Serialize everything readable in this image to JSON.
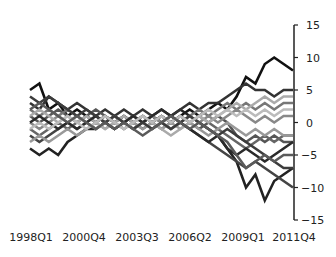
{
  "chart_data": {
    "type": "line",
    "title": "",
    "xlabel": "",
    "ylabel": "",
    "ylim": [
      -15,
      15
    ],
    "y_ticks": [
      15,
      10,
      5,
      0,
      -5,
      -10,
      -15
    ],
    "x_tick_labels": [
      "1998Q1",
      "2000Q4",
      "2003Q3",
      "2006Q2",
      "2009Q1",
      "2011Q4"
    ],
    "y_axis_position": "right",
    "grid": false,
    "legend": "none",
    "x": [
      "1998Q1",
      "1998Q3",
      "1999Q1",
      "1999Q3",
      "2000Q1",
      "2000Q3",
      "2001Q1",
      "2001Q3",
      "2002Q1",
      "2002Q3",
      "2003Q1",
      "2003Q3",
      "2004Q1",
      "2004Q3",
      "2005Q1",
      "2005Q3",
      "2006Q1",
      "2006Q3",
      "2007Q1",
      "2007Q3",
      "2008Q1",
      "2008Q3",
      "2009Q1",
      "2009Q3",
      "2010Q1",
      "2010Q3",
      "2011Q1",
      "2011Q3",
      "2011Q4"
    ],
    "series": [
      {
        "name": "s1",
        "color": "#111111",
        "values": [
          5,
          6,
          2,
          3,
          1,
          2,
          1,
          0,
          1,
          0,
          1,
          0,
          1,
          0,
          1,
          0,
          1,
          2,
          1,
          2,
          3,
          2,
          4,
          7,
          6,
          9,
          10,
          9,
          8
        ]
      },
      {
        "name": "s2",
        "color": "#222222",
        "values": [
          -4,
          -5,
          -4,
          -5,
          -3,
          -2,
          -1,
          -1,
          0,
          -1,
          0,
          -1,
          0,
          1,
          0,
          1,
          2,
          1,
          0,
          -1,
          -2,
          -4,
          -6,
          -10,
          -8,
          -12,
          -9,
          -8,
          -7
        ]
      },
      {
        "name": "s3",
        "color": "#333333",
        "values": [
          3,
          2,
          4,
          3,
          2,
          3,
          2,
          1,
          2,
          1,
          2,
          1,
          2,
          1,
          2,
          1,
          2,
          3,
          2,
          3,
          3,
          4,
          5,
          6,
          5,
          5,
          4,
          5,
          5
        ]
      },
      {
        "name": "s4",
        "color": "#444444",
        "values": [
          -2,
          -3,
          -2,
          -1,
          0,
          -1,
          0,
          -1,
          0,
          1,
          0,
          1,
          0,
          1,
          0,
          -1,
          0,
          -1,
          -2,
          -3,
          -4,
          -5,
          -6,
          -7,
          -6,
          -7,
          -8,
          -9,
          -10
        ]
      },
      {
        "name": "s5",
        "color": "#555555",
        "values": [
          1,
          0,
          1,
          2,
          1,
          0,
          1,
          2,
          1,
          0,
          1,
          0,
          -1,
          0,
          1,
          0,
          1,
          0,
          -1,
          0,
          1,
          0,
          -2,
          -3,
          -2,
          -3,
          -2,
          -3,
          -3
        ]
      },
      {
        "name": "s6",
        "color": "#666666",
        "values": [
          -1,
          -2,
          -1,
          0,
          -1,
          0,
          1,
          0,
          1,
          0,
          -1,
          0,
          1,
          0,
          -1,
          0,
          1,
          0,
          1,
          0,
          -1,
          -2,
          -3,
          -4,
          -3,
          -2,
          -3,
          -2,
          -2
        ]
      },
      {
        "name": "s7",
        "color": "#777777",
        "values": [
          2,
          1,
          2,
          1,
          2,
          1,
          0,
          1,
          0,
          1,
          0,
          1,
          0,
          -1,
          0,
          1,
          0,
          1,
          2,
          1,
          2,
          3,
          2,
          3,
          2,
          3,
          2,
          3,
          3
        ]
      },
      {
        "name": "s8",
        "color": "#888888",
        "values": [
          0,
          -1,
          0,
          1,
          0,
          1,
          0,
          -1,
          0,
          1,
          0,
          -1,
          0,
          1,
          0,
          -1,
          0,
          1,
          0,
          1,
          0,
          1,
          2,
          1,
          0,
          1,
          0,
          1,
          1
        ]
      },
      {
        "name": "s9",
        "color": "#999999",
        "values": [
          -3,
          -2,
          -3,
          -2,
          -1,
          -2,
          -1,
          0,
          -1,
          0,
          -1,
          0,
          -1,
          0,
          -1,
          0,
          -1,
          0,
          -1,
          -2,
          -1,
          0,
          -1,
          -2,
          -1,
          -2,
          -1,
          -2,
          -2
        ]
      },
      {
        "name": "s10",
        "color": "#aaaaaa",
        "values": [
          1,
          2,
          1,
          0,
          1,
          0,
          1,
          0,
          -1,
          0,
          1,
          0,
          1,
          0,
          -1,
          -2,
          -1,
          0,
          1,
          0,
          1,
          2,
          3,
          2,
          3,
          4,
          3,
          4,
          4
        ]
      },
      {
        "name": "s11",
        "color": "#2a2a2a",
        "values": [
          0,
          1,
          0,
          -1,
          0,
          -1,
          0,
          1,
          0,
          -1,
          0,
          1,
          0,
          1,
          2,
          1,
          0,
          -1,
          -2,
          -3,
          -2,
          -4,
          -5,
          -4,
          -5,
          -6,
          -5,
          -4,
          -3
        ]
      },
      {
        "name": "s12",
        "color": "#3c3c3c",
        "values": [
          4,
          3,
          4,
          3,
          2,
          1,
          2,
          1,
          0,
          1,
          0,
          -1,
          0,
          -1,
          0,
          -1,
          0,
          1,
          0,
          -1,
          -2,
          -1,
          -2,
          -3,
          -4,
          -5,
          -6,
          -7,
          -7
        ]
      },
      {
        "name": "s13",
        "color": "#bbbbbb",
        "values": [
          -1,
          0,
          -1,
          0,
          1,
          0,
          -1,
          0,
          1,
          0,
          -1,
          0,
          1,
          0,
          1,
          0,
          1,
          0,
          1,
          2,
          1,
          2,
          1,
          2,
          1,
          2,
          1,
          2,
          2
        ]
      },
      {
        "name": "s14",
        "color": "#5a5a5a",
        "values": [
          2,
          3,
          2,
          1,
          0,
          1,
          0,
          -1,
          0,
          -1,
          0,
          -1,
          -2,
          -1,
          0,
          1,
          0,
          -1,
          0,
          -1,
          -2,
          -3,
          -5,
          -7,
          -6,
          -5,
          -6,
          -5,
          -5
        ]
      }
    ]
  }
}
